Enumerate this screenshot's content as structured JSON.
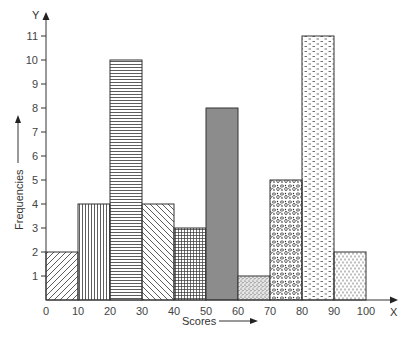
{
  "chart_data": {
    "type": "bar",
    "subtype": "histogram",
    "title": "",
    "xlabel": "Scores",
    "ylabel": "Frequencies",
    "x_axis_letter": "X",
    "y_axis_letter": "Y",
    "categories": [
      "0-10",
      "10-20",
      "20-30",
      "30-40",
      "40-50",
      "50-60",
      "60-70",
      "70-80",
      "80-90",
      "90-100"
    ],
    "bins": [
      [
        0,
        10
      ],
      [
        10,
        20
      ],
      [
        20,
        30
      ],
      [
        30,
        40
      ],
      [
        40,
        50
      ],
      [
        50,
        60
      ],
      [
        60,
        70
      ],
      [
        70,
        80
      ],
      [
        80,
        90
      ],
      [
        90,
        100
      ]
    ],
    "values": [
      2,
      4,
      10,
      4,
      3,
      8,
      1,
      5,
      11,
      2
    ],
    "patterns": [
      "diagonal-up",
      "vertical-lines",
      "horizontal-lines",
      "diagonal-down",
      "grid",
      "solid-gray",
      "stipple",
      "pebbles",
      "dashes",
      "dotted-vertical"
    ],
    "x_ticks": [
      0,
      10,
      20,
      30,
      40,
      50,
      60,
      70,
      80,
      90,
      100
    ],
    "y_ticks": [
      1,
      2,
      3,
      4,
      5,
      6,
      7,
      8,
      9,
      10,
      11
    ],
    "xlim": [
      0,
      100
    ],
    "ylim": [
      0,
      11
    ],
    "grid": false,
    "legend": null,
    "colors": {
      "stroke": "#333333",
      "solid_fill": "#8c8c8c",
      "background": "#ffffff"
    }
  }
}
